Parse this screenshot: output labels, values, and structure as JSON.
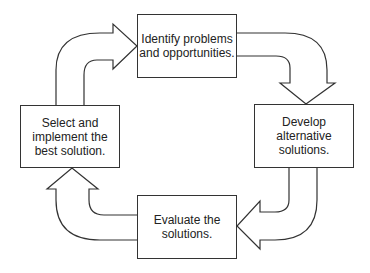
{
  "diagram": {
    "type": "cycle",
    "steps": [
      {
        "id": "identify",
        "label": "Identify problems\nand opportunities."
      },
      {
        "id": "develop",
        "label": "Develop\nalternative\nsolutions."
      },
      {
        "id": "evaluate",
        "label": "Evaluate the\nsolutions."
      },
      {
        "id": "select",
        "label": "Select and\nimplement the\nbest solution."
      }
    ],
    "arrows": [
      {
        "from": "select",
        "to": "identify"
      },
      {
        "from": "identify",
        "to": "develop"
      },
      {
        "from": "develop",
        "to": "evaluate"
      },
      {
        "from": "evaluate",
        "to": "select"
      }
    ],
    "colors": {
      "stroke": "#333333",
      "text": "#222222",
      "fill": "#ffffff"
    }
  }
}
